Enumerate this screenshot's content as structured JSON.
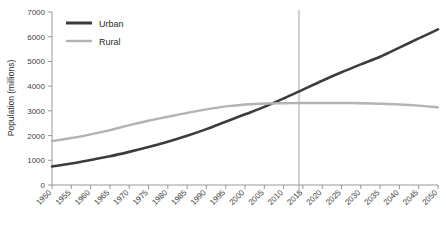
{
  "chart_data": {
    "type": "line",
    "title": "",
    "xlabel": "",
    "ylabel": "Population (millions)",
    "xlim": [
      1950,
      2050
    ],
    "ylim": [
      0,
      7000
    ],
    "grid": false,
    "legend_position": "top-left",
    "x": [
      1950,
      1955,
      1960,
      1965,
      1970,
      1975,
      1980,
      1985,
      1990,
      1995,
      2000,
      2005,
      2010,
      2015,
      2020,
      2025,
      2030,
      2035,
      2040,
      2045,
      2050
    ],
    "xtick_labels": [
      "1950",
      "1955",
      "1960",
      "1965",
      "1970",
      "1975",
      "1980",
      "1985",
      "1990",
      "1995",
      "2000",
      "2005",
      "2010",
      "2015",
      "2020",
      "2025",
      "2030",
      "2035",
      "2040",
      "2045",
      "2050"
    ],
    "ytick_labels": [
      "0",
      "1000",
      "2000",
      "3000",
      "4000",
      "5000",
      "6000",
      "7000"
    ],
    "ytick_values": [
      0,
      1000,
      2000,
      3000,
      4000,
      5000,
      6000,
      7000
    ],
    "series": [
      {
        "name": "Urban",
        "color": "#3c3c3c",
        "width": 2.6,
        "values": [
          750,
          870,
          1010,
          1160,
          1340,
          1535,
          1750,
          1990,
          2260,
          2560,
          2860,
          3160,
          3500,
          3860,
          4220,
          4560,
          4880,
          5190,
          5560,
          5930,
          6300
        ]
      },
      {
        "name": "Rural",
        "color": "#b3b3b3",
        "width": 2.4,
        "values": [
          1780,
          1900,
          2050,
          2220,
          2420,
          2600,
          2760,
          2920,
          3060,
          3180,
          3260,
          3300,
          3310,
          3315,
          3320,
          3320,
          3310,
          3290,
          3260,
          3210,
          3140
        ]
      }
    ],
    "annotations": [
      {
        "type": "vertical-line",
        "x": 2014,
        "color": "#9a9a9a",
        "label": ""
      }
    ]
  },
  "legend": {
    "items": [
      {
        "label": "Urban",
        "color": "#3c3c3c"
      },
      {
        "label": "Rural",
        "color": "#b3b3b3"
      }
    ]
  },
  "axis": {
    "y_title": "Population (millions)"
  },
  "caption": {
    "text": ""
  }
}
